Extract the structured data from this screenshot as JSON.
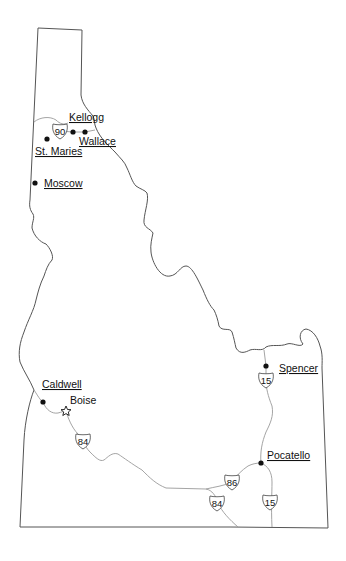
{
  "map": {
    "region": "Idaho",
    "colors": {
      "border": "#555555",
      "highway": "#9a9a9a",
      "marker": "#111111",
      "background": "#ffffff"
    }
  },
  "cities": [
    {
      "name": "Kellogg",
      "x": 73,
      "y": 132,
      "label_x": 69,
      "label_y": 121,
      "type": "city",
      "linked": true
    },
    {
      "name": "Wallace",
      "x": 85,
      "y": 132,
      "label_x": 79,
      "label_y": 145,
      "type": "city",
      "linked": true
    },
    {
      "name": "St. Maries",
      "x": 47,
      "y": 139,
      "label_x": 35,
      "label_y": 155,
      "type": "city",
      "linked": true
    },
    {
      "name": "Moscow",
      "x": 35,
      "y": 183,
      "label_x": 44,
      "label_y": 187,
      "type": "city",
      "linked": true
    },
    {
      "name": "Caldwell",
      "x": 43,
      "y": 402,
      "label_x": 42,
      "label_y": 388,
      "type": "city",
      "linked": true
    },
    {
      "name": "Boise",
      "x": 66,
      "y": 411,
      "label_x": 70,
      "label_y": 404,
      "type": "capital",
      "linked": false
    },
    {
      "name": "Spencer",
      "x": 266,
      "y": 366,
      "label_x": 279,
      "label_y": 372,
      "type": "city",
      "linked": true
    },
    {
      "name": "Pocatello",
      "x": 261,
      "y": 463,
      "label_x": 267,
      "label_y": 459,
      "type": "city",
      "linked": true
    }
  ],
  "highways": [
    {
      "route": "90",
      "shield_x": 60,
      "shield_y": 131
    },
    {
      "route": "84",
      "shield_x": 83,
      "shield_y": 441
    },
    {
      "route": "15",
      "shield_x": 266,
      "shield_y": 380
    },
    {
      "route": "86",
      "shield_x": 232,
      "shield_y": 482
    },
    {
      "route": "84",
      "shield_x": 217,
      "shield_y": 503
    },
    {
      "route": "15",
      "shield_x": 270,
      "shield_y": 502
    }
  ]
}
